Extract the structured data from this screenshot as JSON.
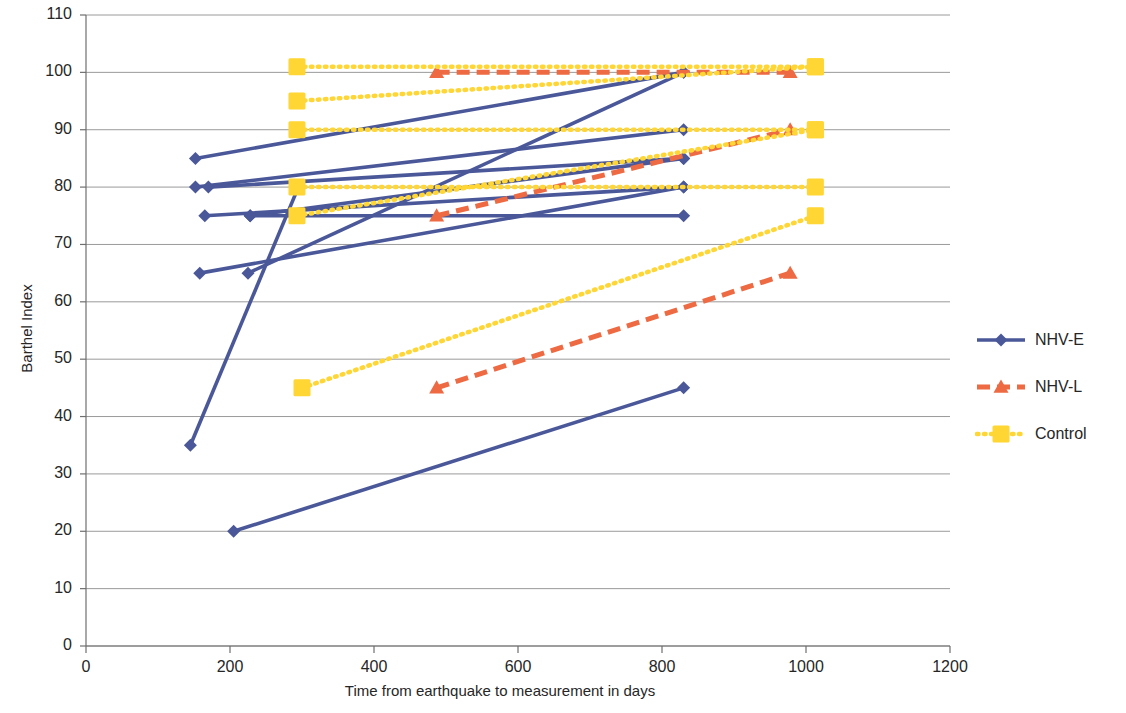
{
  "chart_data": {
    "type": "line",
    "title": "",
    "xlabel": "Time from earthquake to measurement in days",
    "ylabel": "Barthel Index",
    "xlim": [
      0,
      1200
    ],
    "ylim": [
      0,
      110
    ],
    "xticks": [
      0,
      200,
      400,
      600,
      800,
      1000,
      1200
    ],
    "yticks": [
      0,
      10,
      20,
      30,
      40,
      50,
      60,
      70,
      80,
      90,
      100,
      110
    ],
    "grid": "horizontal",
    "legend_position": "right",
    "series": [
      {
        "name": "NHV-E",
        "color": "#4A5899",
        "marker": "diamond",
        "linestyle": "solid",
        "segments": [
          {
            "x": [
              152,
              830
            ],
            "y": [
              85,
              100
            ]
          },
          {
            "x": [
              152,
              830
            ],
            "y": [
              80,
              90
            ]
          },
          {
            "x": [
              170,
              830
            ],
            "y": [
              80,
              85
            ]
          },
          {
            "x": [
              165,
              830
            ],
            "y": [
              75,
              80
            ]
          },
          {
            "x": [
              228,
              830
            ],
            "y": [
              75,
              85
            ]
          },
          {
            "x": [
              158,
              830
            ],
            "y": [
              65,
              80
            ]
          },
          {
            "x": [
              225,
              830
            ],
            "y": [
              65,
              100
            ]
          },
          {
            "x": [
              145,
              295
            ],
            "y": [
              35,
              80
            ]
          },
          {
            "x": [
              205,
              830
            ],
            "y": [
              20,
              45
            ]
          },
          {
            "x": [
              228,
              830
            ],
            "y": [
              75,
              75
            ]
          }
        ]
      },
      {
        "name": "NHV-L",
        "color": "#ED6A42",
        "marker": "triangle",
        "linestyle": "dashed",
        "segments": [
          {
            "x": [
              487,
              978
            ],
            "y": [
              100,
              100
            ]
          },
          {
            "x": [
              487,
              978
            ],
            "y": [
              75,
              90
            ]
          },
          {
            "x": [
              487,
              978
            ],
            "y": [
              45,
              65
            ]
          }
        ]
      },
      {
        "name": "Control",
        "color": "#FFD633",
        "marker": "square",
        "linestyle": "dotted",
        "segments": [
          {
            "x": [
              293,
              1013
            ],
            "y": [
              101,
              101
            ]
          },
          {
            "x": [
              293,
              1013
            ],
            "y": [
              95,
              101
            ]
          },
          {
            "x": [
              293,
              1013
            ],
            "y": [
              90,
              90
            ]
          },
          {
            "x": [
              293,
              1013
            ],
            "y": [
              80,
              80
            ]
          },
          {
            "x": [
              293,
              1013
            ],
            "y": [
              75,
              90
            ]
          },
          {
            "x": [
              300,
              1013
            ],
            "y": [
              45,
              75
            ]
          }
        ]
      }
    ],
    "legend": [
      {
        "label": "NHV-E",
        "color": "#4A5899",
        "marker": "diamond",
        "linestyle": "solid"
      },
      {
        "label": "NHV-L",
        "color": "#ED6A42",
        "marker": "triangle",
        "linestyle": "dashed"
      },
      {
        "label": "Control",
        "color": "#FFD633",
        "marker": "square",
        "linestyle": "dotted"
      }
    ]
  },
  "axes": {
    "x_title": "Time from earthquake to measurement in days",
    "y_title": "Barthel Index",
    "x_tick_labels": [
      "0",
      "200",
      "400",
      "600",
      "800",
      "1000",
      "1200"
    ],
    "y_tick_labels": [
      "0",
      "10",
      "20",
      "30",
      "40",
      "50",
      "60",
      "70",
      "80",
      "90",
      "100",
      "110"
    ]
  },
  "legend": {
    "items": [
      {
        "label": "NHV-E"
      },
      {
        "label": "NHV-L"
      },
      {
        "label": "Control"
      }
    ]
  },
  "colors": {
    "series_nhv_e": "#4A5899",
    "series_nhv_l": "#ED6A42",
    "series_control": "#FFD633",
    "grid": "#9a9a9a",
    "axis": "#6f6f6f",
    "text": "#262626"
  }
}
